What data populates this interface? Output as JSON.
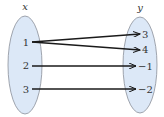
{
  "diagram": {
    "type": "mapping",
    "colors": {
      "set_fill": "#dce8f7",
      "set_stroke": "#8a8f99",
      "arrow": "#1a1a1a",
      "text": "#333333"
    },
    "domain": {
      "title": "x",
      "elements": [
        "1",
        "2",
        "3"
      ]
    },
    "range": {
      "title": "y",
      "elements": [
        "3",
        "4",
        "−1",
        "−2"
      ]
    },
    "mappings": [
      {
        "from": "1",
        "to": "3"
      },
      {
        "from": "1",
        "to": "4"
      },
      {
        "from": "2",
        "to": "−1"
      },
      {
        "from": "3",
        "to": "−2"
      }
    ]
  }
}
